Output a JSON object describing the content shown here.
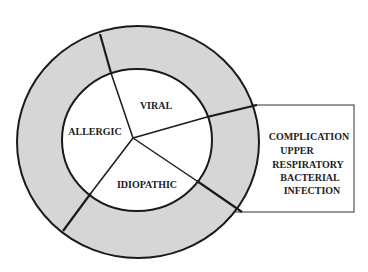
{
  "diagram": {
    "inner_segments": [
      {
        "label": "VIRAL"
      },
      {
        "label": "ALLERGIC"
      },
      {
        "label": "IDIOPATHIC"
      }
    ],
    "outer_ring_label": [
      "COMPLICATION",
      "UPPER",
      "RESPIRATORY",
      "BACTERIAL",
      "INFECTION"
    ],
    "colors": {
      "ring_fill": "#d6d6d6",
      "inner_fill": "#ffffff",
      "stroke": "#1a1a1a"
    }
  }
}
